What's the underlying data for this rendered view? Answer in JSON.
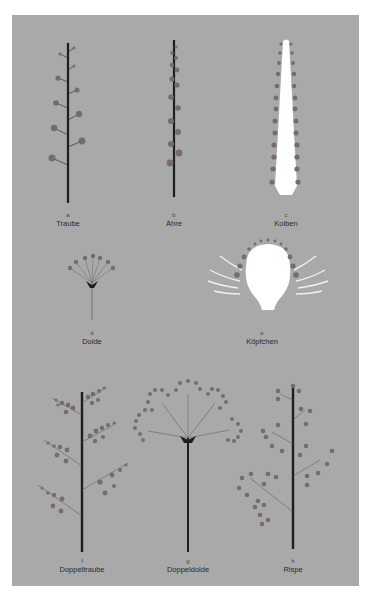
{
  "figure": {
    "colors": {
      "page_background": "#ffffff",
      "panel_background": "#a9a9a9",
      "stem": "#1e1e1e",
      "flower": "#7a6b6b",
      "receptacle": "#ffffff"
    },
    "items": [
      {
        "letter": "a",
        "name": "Traube"
      },
      {
        "letter": "b",
        "name": "Ähre"
      },
      {
        "letter": "c",
        "name": "Kolben"
      },
      {
        "letter": "d",
        "name": "Dolde"
      },
      {
        "letter": "e",
        "name": "Köpfchen"
      },
      {
        "letter": "f",
        "name": "Doppeltraube"
      },
      {
        "letter": "g",
        "name": "Doppeldolde"
      },
      {
        "letter": "h",
        "name": "Rispe"
      }
    ]
  }
}
